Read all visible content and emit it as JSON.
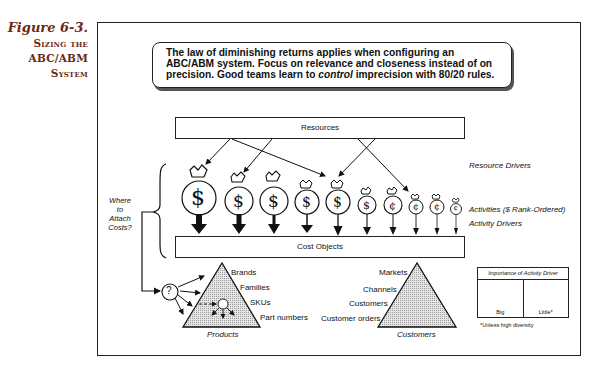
{
  "caption": {
    "figure": "Figure 6-3.",
    "title_lines": [
      "Sizing the",
      "ABC/ABM",
      "System"
    ]
  },
  "quote": {
    "line1": "The law of diminishing returns applies when configuring an",
    "line2": "ABC/ABM system.  Focus on relevance and closeness instead of on",
    "line3_pre": "precision.  Good teams learn to ",
    "line3_em": "control",
    "line3_post": " imprecision with 80/20 rules."
  },
  "boxes": {
    "resources": "Resources",
    "cost_objects": "Cost Objects"
  },
  "side_labels": {
    "resource_drivers": "Resource Drivers",
    "activities": "Activities ($ Rank-Ordered)",
    "activity_drivers": "Activity Drivers"
  },
  "where_label": [
    "Where",
    "to",
    "Attach",
    "Costs?"
  ],
  "question_mark": "?",
  "activities": [
    {
      "symbol": "$",
      "size": "xl",
      "arrow": "big"
    },
    {
      "symbol": "$",
      "size": "l",
      "arrow": "big"
    },
    {
      "symbol": "$",
      "size": "l",
      "arrow": "big"
    },
    {
      "symbol": "$",
      "size": "m",
      "arrow": "medium"
    },
    {
      "symbol": "$",
      "size": "m",
      "arrow": "medium"
    },
    {
      "symbol": "$",
      "size": "s",
      "arrow": "medium"
    },
    {
      "symbol": "¢",
      "size": "s",
      "arrow": "little"
    },
    {
      "symbol": "¢",
      "size": "xs",
      "arrow": "little"
    },
    {
      "symbol": "¢",
      "size": "xs",
      "arrow": "little"
    },
    {
      "symbol": "¢",
      "size": "xxs",
      "arrow": "little"
    }
  ],
  "products": {
    "title": "Products",
    "levels": [
      "Brands",
      "Families",
      "SKUs",
      "Part numbers"
    ]
  },
  "customers": {
    "title": "Customers",
    "levels": [
      "Markets",
      "Channels",
      "Customers",
      "Customer orders"
    ]
  },
  "legend": {
    "header": "Importance of Activity Driver",
    "big": "Big",
    "little": "Little*",
    "footnote": "*Unless high diversity"
  }
}
